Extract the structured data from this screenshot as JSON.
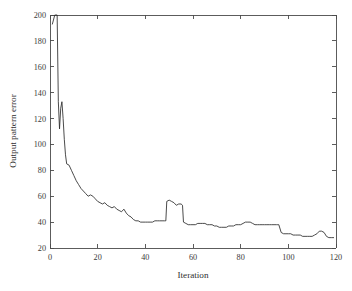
{
  "chart_data": {
    "type": "line",
    "title": "",
    "xlabel": "Iteration",
    "ylabel": "Output pattern error",
    "xlim": [
      0,
      120
    ],
    "ylim": [
      20,
      200
    ],
    "xticks": [
      0,
      20,
      40,
      60,
      80,
      100,
      120
    ],
    "yticks": [
      20,
      40,
      60,
      80,
      100,
      120,
      140,
      160,
      180,
      200
    ],
    "grid": false,
    "legend": null,
    "line_color": "#2b2b2b",
    "background_color": "#ffffff",
    "frame_color": "#4a4a4a",
    "series": [
      {
        "name": "Output pattern error",
        "x": [
          1,
          2,
          3,
          3.5,
          4,
          4.5,
          5,
          5.5,
          6,
          6.5,
          7,
          8,
          9,
          10,
          11,
          12,
          13,
          14,
          15,
          16,
          17,
          18,
          19,
          20,
          21,
          22,
          23,
          24,
          25,
          26,
          27,
          28,
          29,
          30,
          31,
          32,
          33,
          34,
          35,
          36,
          37,
          38,
          39,
          40,
          41,
          42,
          43,
          44,
          45,
          46,
          47,
          48,
          48.6,
          49,
          50,
          51,
          52,
          53,
          54,
          55,
          55.6,
          56,
          57,
          58,
          59,
          60,
          61,
          62,
          63,
          64,
          65,
          66,
          67,
          68,
          69,
          70,
          71,
          72,
          73,
          74,
          75,
          76,
          77,
          78,
          79,
          80,
          81,
          82,
          83,
          84,
          85,
          86,
          87,
          88,
          89,
          90,
          91,
          92,
          93,
          94,
          95,
          95.6,
          96,
          97,
          98,
          99,
          100,
          101,
          102,
          103,
          104,
          105,
          106,
          107,
          108,
          109,
          110,
          111,
          112,
          113,
          114,
          115,
          116,
          117,
          118,
          119
        ],
        "y": [
          193,
          200,
          200,
          133,
          112,
          128,
          133,
          120,
          104,
          92,
          85,
          84,
          80,
          76,
          72,
          69,
          66,
          64,
          62,
          60,
          61,
          60,
          58,
          56,
          55,
          54,
          55,
          53,
          52,
          51,
          52,
          50,
          49,
          48,
          50,
          47,
          45,
          44,
          42,
          41,
          41,
          40,
          40,
          40,
          40,
          40,
          40,
          41,
          41,
          41,
          41,
          41,
          41,
          56,
          57,
          56,
          55,
          53,
          54,
          54,
          53,
          40,
          39,
          38,
          38,
          38,
          38,
          39,
          39,
          39,
          39,
          38,
          38,
          38,
          37,
          37,
          36,
          36,
          36,
          36,
          37,
          37,
          37,
          38,
          38,
          38,
          39,
          40,
          40,
          40,
          39,
          38,
          38,
          38,
          38,
          38,
          38,
          38,
          38,
          38,
          38,
          38,
          38,
          32,
          31,
          31,
          31,
          31,
          30,
          30,
          30,
          30,
          29,
          29,
          29,
          29,
          29,
          30,
          31,
          33,
          33,
          32,
          29,
          28,
          28,
          28
        ]
      }
    ]
  },
  "axes": {
    "x_tick_labels": [
      "0",
      "20",
      "40",
      "60",
      "80",
      "100",
      "120"
    ],
    "y_tick_labels": [
      "20",
      "40",
      "60",
      "80",
      "100",
      "120",
      "140",
      "160",
      "180",
      "200"
    ],
    "x_axis_title": "Iteration",
    "y_axis_title": "Output pattern error"
  }
}
